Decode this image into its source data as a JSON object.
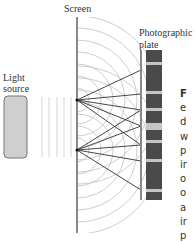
{
  "labels": {
    "screen": "Screen",
    "plate_line1": "Photographic",
    "plate_line2": "plate",
    "light_line1": "Light",
    "light_line2": "source"
  },
  "caption_fragments": [
    "F",
    "e",
    "d",
    "w",
    "p",
    "ir",
    "o",
    "o",
    "a",
    "ir",
    "p"
  ],
  "colors": {
    "screen": "#8a8a8a",
    "wavefront": "#c8c8c8",
    "ray": "#333333",
    "plate_dark": "#4a4a4a",
    "plate_light": "#c4c4c4",
    "source_fill": "#cfcfcf",
    "source_stroke": "#777777"
  }
}
